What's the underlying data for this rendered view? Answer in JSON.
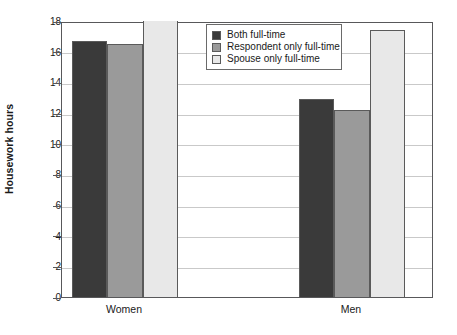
{
  "chart_data": {
    "type": "bar",
    "title": "",
    "xlabel": "",
    "ylabel": "Housework hours",
    "categories": [
      "Women",
      "Men"
    ],
    "series": [
      {
        "name": "Both full-time",
        "color": "#3a3a3a",
        "values": [
          16.7,
          12.9
        ]
      },
      {
        "name": "Respondent only full-time",
        "color": "#9a9a9a",
        "values": [
          16.5,
          12.2
        ]
      },
      {
        "name": "Spouse only full-time",
        "color": "#e8e8e8",
        "values": [
          18.0,
          17.4
        ]
      }
    ],
    "ylim": [
      0,
      18
    ],
    "ytick_step": 2,
    "yticks": [
      0,
      2,
      4,
      6,
      8,
      10,
      12,
      14,
      16,
      18
    ],
    "ytick_labels": [
      "0",
      "2",
      "4",
      "6",
      "8",
      "10",
      "12",
      "14",
      "16",
      "18"
    ],
    "grid": true,
    "grid_axis": "y",
    "legend_position": "top-center"
  },
  "legend": {
    "entries": [
      {
        "label": "Both full-time",
        "swatch": "#3a3a3a"
      },
      {
        "label": "Respondent only full-time",
        "swatch": "#9a9a9a"
      },
      {
        "label": "Spouse only full-time",
        "swatch": "#e8e8e8"
      }
    ]
  },
  "axes": {
    "y_title": "Housework hours"
  }
}
